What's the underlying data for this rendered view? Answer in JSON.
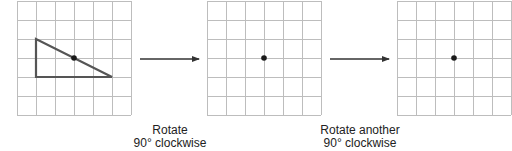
{
  "grid": {
    "rows": 6,
    "cols": 6,
    "cell_px": 19,
    "line_color": "#bdbdbd"
  },
  "panels": [
    {
      "id": "original",
      "origin": [
        17,
        1
      ],
      "center_dot": [
        74,
        58
      ],
      "shape": {
        "type": "right-triangle",
        "points": [
          [
            36,
            39
          ],
          [
            36,
            77
          ],
          [
            112,
            77
          ]
        ],
        "stroke": "#555555"
      }
    },
    {
      "id": "after-first-rotation",
      "origin": [
        207,
        1
      ],
      "center_dot": [
        264,
        58
      ],
      "shape": null
    },
    {
      "id": "after-second-rotation",
      "origin": [
        397,
        1
      ],
      "center_dot": [
        454,
        58
      ],
      "shape": null
    }
  ],
  "arrows": [
    {
      "from": [
        140,
        59
      ],
      "to": [
        199,
        59
      ]
    },
    {
      "from": [
        330,
        59
      ],
      "to": [
        389,
        59
      ]
    }
  ],
  "captions": [
    {
      "line1": "Rotate",
      "line2": "90° clockwise"
    },
    {
      "line1": "Rotate another",
      "line2": "90° clockwise"
    }
  ],
  "colors": {
    "dot": "#1a1a1a",
    "arrow": "#333333",
    "shape_stroke": "#555555"
  }
}
